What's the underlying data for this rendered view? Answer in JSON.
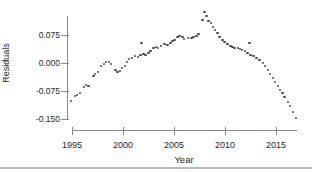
{
  "chart_data": {
    "type": "scatter",
    "title": "",
    "xlabel": "Year",
    "ylabel": "Residuals",
    "xlim": [
      1993.5,
      2017.5
    ],
    "ylim": [
      -0.168,
      0.155
    ],
    "grid": false,
    "legend_position": "none",
    "point_color": "#4a4a4a",
    "axis_color": "#8c8c8c",
    "x_ticks": [
      1995,
      2000,
      2005,
      2010,
      2015
    ],
    "x_tick_labels": [
      "1995",
      "2000",
      "2005",
      "2010",
      "2015"
    ],
    "y_ticks": [
      0.075,
      0.0,
      -0.075,
      -0.15
    ],
    "y_tick_labels": [
      "0.075",
      "0.000",
      "-0.075",
      "-0.150"
    ],
    "points": [
      [
        1994.9,
        -0.102
      ],
      [
        1995.3,
        -0.088
      ],
      [
        1995.5,
        -0.086
      ],
      [
        1995.8,
        -0.08
      ],
      [
        1996.2,
        -0.064
      ],
      [
        1996.4,
        -0.059
      ],
      [
        1996.6,
        -0.062
      ],
      [
        1997.1,
        -0.035
      ],
      [
        1997.25,
        -0.029
      ],
      [
        1997.55,
        -0.024
      ],
      [
        1997.85,
        -0.008
      ],
      [
        1998.15,
        -0.003
      ],
      [
        1998.35,
        0.003
      ],
      [
        1998.65,
        0.003
      ],
      [
        1998.85,
        -0.003
      ],
      [
        1999.25,
        -0.019
      ],
      [
        1999.45,
        -0.024
      ],
      [
        1999.7,
        -0.021
      ],
      [
        1999.9,
        -0.013
      ],
      [
        2000.2,
        -0.008
      ],
      [
        2000.4,
        0.003
      ],
      [
        2000.6,
        0.011
      ],
      [
        2000.9,
        0.013
      ],
      [
        2001.2,
        0.019
      ],
      [
        2001.5,
        0.016
      ],
      [
        2001.7,
        0.021
      ],
      [
        2001.8,
        0.054
      ],
      [
        2002.0,
        0.024
      ],
      [
        2002.2,
        0.021
      ],
      [
        2002.5,
        0.027
      ],
      [
        2002.7,
        0.032
      ],
      [
        2003.0,
        0.04
      ],
      [
        2003.25,
        0.043
      ],
      [
        2003.45,
        0.04
      ],
      [
        2003.75,
        0.046
      ],
      [
        2004.05,
        0.051
      ],
      [
        2004.35,
        0.048
      ],
      [
        2004.65,
        0.054
      ],
      [
        2004.85,
        0.059
      ],
      [
        2005.05,
        0.062
      ],
      [
        2005.35,
        0.07
      ],
      [
        2005.55,
        0.072
      ],
      [
        2005.85,
        0.07
      ],
      [
        2006.0,
        0.064
      ],
      [
        2006.4,
        0.067
      ],
      [
        2006.7,
        0.067
      ],
      [
        2006.9,
        0.07
      ],
      [
        2007.2,
        0.072
      ],
      [
        2007.4,
        0.078
      ],
      [
        2007.8,
        0.115
      ],
      [
        2008.0,
        0.137
      ],
      [
        2008.2,
        0.126
      ],
      [
        2008.4,
        0.113
      ],
      [
        2008.6,
        0.107
      ],
      [
        2008.8,
        0.096
      ],
      [
        2009.0,
        0.088
      ],
      [
        2009.25,
        0.08
      ],
      [
        2009.45,
        0.07
      ],
      [
        2009.75,
        0.062
      ],
      [
        2009.95,
        0.056
      ],
      [
        2010.25,
        0.051
      ],
      [
        2010.55,
        0.046
      ],
      [
        2010.75,
        0.043
      ],
      [
        2010.95,
        0.04
      ],
      [
        2011.25,
        0.04
      ],
      [
        2011.45,
        0.038
      ],
      [
        2011.65,
        0.035
      ],
      [
        2011.95,
        0.032
      ],
      [
        2012.2,
        0.027
      ],
      [
        2012.4,
        0.054
      ],
      [
        2012.5,
        0.021
      ],
      [
        2012.8,
        0.019
      ],
      [
        2013.1,
        0.013
      ],
      [
        2013.4,
        0.008
      ],
      [
        2013.7,
        0.0
      ],
      [
        2013.9,
        -0.008
      ],
      [
        2014.2,
        -0.019
      ],
      [
        2014.4,
        -0.029
      ],
      [
        2014.7,
        -0.04
      ],
      [
        2014.9,
        -0.051
      ],
      [
        2015.2,
        -0.062
      ],
      [
        2015.4,
        -0.072
      ],
      [
        2015.65,
        -0.08
      ],
      [
        2015.85,
        -0.091
      ],
      [
        2016.15,
        -0.104
      ],
      [
        2016.35,
        -0.115
      ],
      [
        2016.65,
        -0.131
      ],
      [
        2016.95,
        -0.147
      ]
    ]
  }
}
